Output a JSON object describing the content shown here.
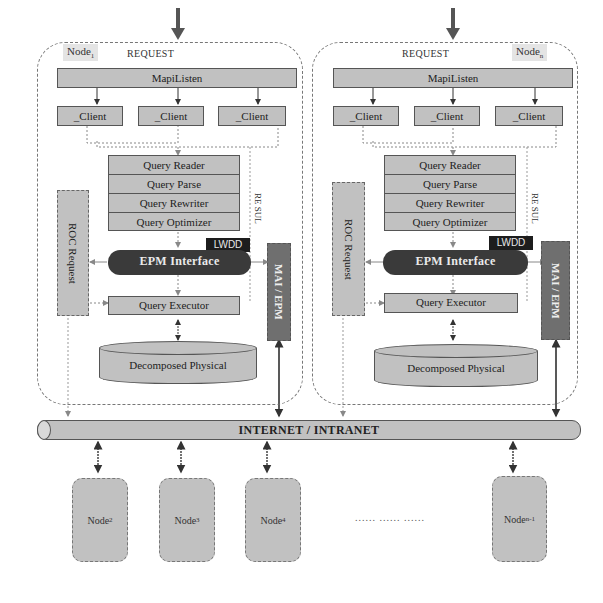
{
  "node_left": {
    "label": "Node",
    "label_sub": "1",
    "request_label": "REQUEST",
    "maplisten_label": "MapiListen",
    "clients": [
      "_Client",
      "_Client",
      "_Client"
    ],
    "query_stack": [
      "Query Reader",
      "Query Parse",
      "Query Rewriter",
      "Query Optimizer"
    ],
    "roc_label": "ROC Request",
    "resul_label": "RE SUL",
    "lwdd_label": "LWDD",
    "epm_label": "EPM Interface",
    "mai_label": "MAI / EPM",
    "executor_label": "Query Executor",
    "storage_label": "Decomposed Physical"
  },
  "node_right": {
    "label": "Node",
    "label_sub": "n",
    "request_label": "REQUEST",
    "maplisten_label": "MapiListen",
    "clients": [
      "_Client",
      "_Client",
      "_Client"
    ],
    "query_stack": [
      "Query Reader",
      "Query Parse",
      "Query Rewriter",
      "Query Optimizer"
    ],
    "roc_label": "ROC Request",
    "resul_label": "RE SUL",
    "lwdd_label": "LWDD",
    "epm_label": "EPM Interface",
    "mai_label": "MAI / EPM",
    "executor_label": "Query Executor",
    "storage_label": "Decomposed Physical"
  },
  "network": {
    "label": "INTERNET / INTRANET"
  },
  "remote_nodes": [
    {
      "label": "Node",
      "sub": "2"
    },
    {
      "label": "Node",
      "sub": "3"
    },
    {
      "label": "Node",
      "sub": "4"
    },
    {
      "label": "Node",
      "sub": "n-1"
    }
  ],
  "ellipsis": "...... ...... ......",
  "colors": {
    "light_fill": "#d6d6d6",
    "mid_fill": "#9a9a9a",
    "dark_fill": "#5c5c5c",
    "lwdd_fill": "#1d1d1d",
    "frame": "#777777"
  }
}
